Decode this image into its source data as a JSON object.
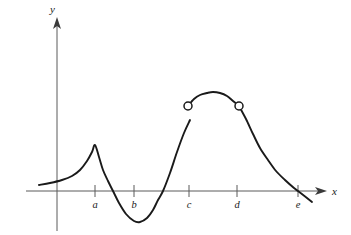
{
  "chart_data": {
    "type": "line",
    "title": "",
    "subtitle": "",
    "xlabel": "x",
    "ylabel": "y",
    "grid": false,
    "legend": null,
    "annotations": [
      "Graph of a function f with a corner (cusp) at x = a",
      "Local minimum between b and c",
      "Removable/jump discontinuity: open circles at x = c and x = d",
      "Curve crosses the x-axis near x = e"
    ],
    "axes": {
      "x_axis": {
        "label": "x",
        "arrow": true,
        "tick_labels": [
          "a",
          "b",
          "c",
          "d",
          "e"
        ]
      },
      "y_axis": {
        "label": "y",
        "arrow": true,
        "tick_labels": []
      }
    },
    "xtick_labels": [
      "a",
      "b",
      "c",
      "d",
      "e"
    ],
    "xtick_positions_px": [
      95,
      134,
      189,
      237,
      298
    ],
    "x_axis_y_px": 191,
    "y_axis_x_px": 57,
    "series": [
      {
        "name": "f",
        "segment": "left-branch",
        "description": "rises slowly from the left to a sharp corner at x = a, then falls steeply through the axis to a smooth minimum, then rises steeply to an open endpoint above x = c",
        "points_px": [
          [
            39,
            185
          ],
          [
            50,
            183
          ],
          [
            62,
            180
          ],
          [
            72,
            176
          ],
          [
            80,
            170
          ],
          [
            87,
            161
          ],
          [
            92,
            152
          ],
          [
            95,
            145
          ],
          [
            99,
            157
          ],
          [
            103,
            170
          ],
          [
            108,
            181
          ],
          [
            113,
            191
          ],
          [
            119,
            203
          ],
          [
            126,
            214
          ],
          [
            134,
            221
          ],
          [
            140,
            222
          ],
          [
            147,
            218
          ],
          [
            153,
            210
          ],
          [
            158,
            200
          ],
          [
            163,
            191
          ],
          [
            170,
            173
          ],
          [
            177,
            152
          ],
          [
            184,
            133
          ],
          [
            190,
            120
          ]
        ]
      },
      {
        "name": "f",
        "segment": "arch",
        "description": "smooth arch between the two open circles, peaking near the middle",
        "points_px": [
          [
            188,
            106
          ],
          [
            194,
            99
          ],
          [
            200,
            95
          ],
          [
            207,
            93
          ],
          [
            213,
            92
          ],
          [
            220,
            93
          ],
          [
            227,
            96
          ],
          [
            233,
            101
          ],
          [
            239,
            106
          ]
        ]
      },
      {
        "name": "f",
        "segment": "right-branch",
        "description": "falls from the open circle at x = d, concave up, crossing the x-axis at x = e and continuing below",
        "points_px": [
          [
            239,
            106
          ],
          [
            246,
            119
          ],
          [
            253,
            134
          ],
          [
            260,
            148
          ],
          [
            268,
            160
          ],
          [
            276,
            171
          ],
          [
            285,
            180
          ],
          [
            294,
            188
          ],
          [
            298,
            191
          ],
          [
            312,
            202
          ]
        ]
      }
    ],
    "open_points": [
      {
        "label": "discontinuity-at-c",
        "x_px": 188,
        "y_px": 106
      },
      {
        "label": "discontinuity-at-d",
        "x_px": 239,
        "y_px": 106
      }
    ],
    "colors": {
      "curve": "#1a1a1a",
      "axis": "#5a5a5a",
      "background": "#ffffff",
      "label": "#1a1a1a"
    }
  },
  "labels": {
    "y_axis": "y",
    "x_axis": "x",
    "tick_a": "a",
    "tick_b": "b",
    "tick_c": "c",
    "tick_d": "d",
    "tick_e": "e"
  }
}
